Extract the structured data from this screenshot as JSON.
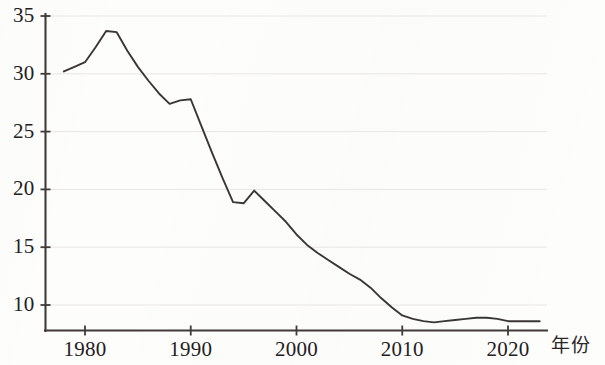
{
  "chart_data": {
    "type": "line",
    "title": "",
    "xlabel": "年份",
    "ylabel": "",
    "xlim": [
      1977.2,
      2023.8
    ],
    "ylim": [
      7.4,
      35.6
    ],
    "grid": true,
    "grid_axis": "y",
    "legend": null,
    "xticks": [
      1980,
      1990,
      2000,
      2010,
      2020
    ],
    "xtick_labels": [
      "1980",
      "1990",
      "2000",
      "2010",
      "2020"
    ],
    "yticks": [
      10,
      15,
      20,
      25,
      30,
      35
    ],
    "ytick_labels": [
      "10",
      "15",
      "20",
      "25",
      "30",
      "35"
    ],
    "line_color": "#3a3634",
    "series": [
      {
        "name": "",
        "x": [
          1978,
          1979,
          1980,
          1981,
          1982,
          1983,
          1984,
          1985,
          1986,
          1987,
          1988,
          1989,
          1990,
          1991,
          1992,
          1993,
          1994,
          1995,
          1996,
          1997,
          1998,
          1999,
          2000,
          2001,
          2002,
          2003,
          2004,
          2005,
          2006,
          2007,
          2008,
          2009,
          2010,
          2011,
          2012,
          2013,
          2014,
          2015,
          2016,
          2017,
          2018,
          2019,
          2020,
          2021,
          2022,
          2023
        ],
        "values": [
          30.2,
          30.6,
          31.0,
          32.3,
          33.7,
          33.6,
          32.0,
          30.6,
          29.4,
          28.3,
          27.4,
          27.7,
          27.8,
          25.5,
          23.2,
          21.0,
          18.9,
          18.8,
          19.9,
          19.0,
          18.1,
          17.2,
          16.1,
          15.2,
          14.5,
          13.9,
          13.3,
          12.7,
          12.2,
          11.5,
          10.6,
          9.8,
          9.1,
          8.8,
          8.6,
          8.5,
          8.6,
          8.7,
          8.8,
          8.9,
          8.9,
          8.8,
          8.6,
          8.6,
          8.6,
          8.6
        ]
      }
    ]
  },
  "axes": {
    "ytick_labels": [
      "35",
      "30",
      "25",
      "20",
      "15",
      "10"
    ],
    "xtick_labels": [
      "1980",
      "1990",
      "2000",
      "2010",
      "2020"
    ],
    "xaxis_title": "年份"
  }
}
